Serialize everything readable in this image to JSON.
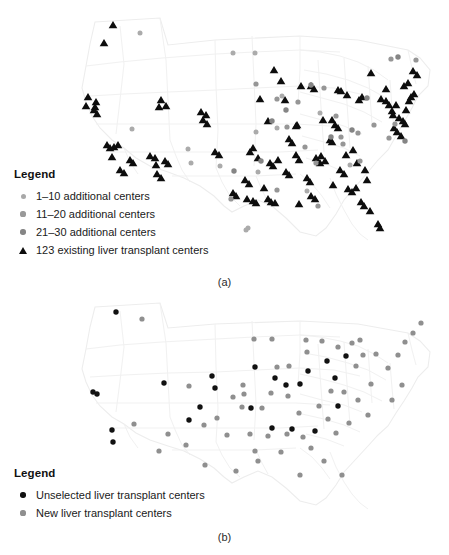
{
  "figure": {
    "background_color": "#ffffff",
    "map_outline_color": "#f2f2f2",
    "map_outline_color_inner": "#f5f5f5"
  },
  "panel_a": {
    "sublabel": "(a)",
    "legend": {
      "title": "Legend",
      "items": [
        {
          "label": "1–10 additional centers",
          "marker": "circle-icon",
          "color": "#a8a8a8",
          "size": 5.0
        },
        {
          "label": "11–20 additional centers",
          "marker": "circle-icon",
          "color": "#999999",
          "size": 5.2
        },
        {
          "label": "21–30 additional centers",
          "marker": "circle-icon",
          "color": "#858585",
          "size": 5.4
        },
        {
          "label": "123 existing liver transplant centers",
          "marker": "triangle-icon",
          "color": "#0d0d0d",
          "size": 7.2
        }
      ]
    },
    "chart_data": {
      "type": "scatter",
      "title": "",
      "subtitle": "",
      "xlabel": "",
      "ylabel": "",
      "grid": false,
      "legend_position": "lower-left",
      "projection": "usa-albers",
      "xlim": [
        0,
        449
      ],
      "ylim": [
        0,
        270
      ],
      "series": [
        {
          "name": "123 existing liver transplant centers",
          "marker": "triangle",
          "color": "#0d0d0d",
          "size": 7.2,
          "count": 123,
          "points": [
            [
              113,
              25
            ],
            [
              104,
              43
            ],
            [
              161,
              100
            ],
            [
              159,
              107
            ],
            [
              166,
              106
            ],
            [
              88,
              97
            ],
            [
              96,
              102
            ],
            [
              95,
              107
            ],
            [
              107,
              145
            ],
            [
              110,
              148
            ],
            [
              114,
              147
            ],
            [
              118,
              145
            ],
            [
              112,
              157
            ],
            [
              150,
              156
            ],
            [
              155,
              158
            ],
            [
              156,
              165
            ],
            [
              201,
              112
            ],
            [
              206,
              115
            ],
            [
              274,
              70
            ],
            [
              281,
              81
            ],
            [
              301,
              86
            ],
            [
              311,
              86
            ],
            [
              314,
              89
            ],
            [
              338,
              90
            ],
            [
              341,
              91
            ],
            [
              347,
              95
            ],
            [
              260,
              99
            ],
            [
              285,
              100
            ],
            [
              297,
              125
            ],
            [
              268,
              121
            ],
            [
              296,
              126
            ],
            [
              332,
              120
            ],
            [
              335,
              125
            ],
            [
              338,
              128
            ],
            [
              323,
              120
            ],
            [
              371,
              73
            ],
            [
              381,
              99
            ],
            [
              386,
              101
            ],
            [
              389,
              105
            ],
            [
              392,
              111
            ],
            [
              393,
              115
            ],
            [
              396,
              105
            ],
            [
              399,
              118
            ],
            [
              403,
              121
            ],
            [
              405,
              124
            ],
            [
              394,
              128
            ],
            [
              397,
              132
            ],
            [
              401,
              136
            ],
            [
              406,
              110
            ],
            [
              409,
              101
            ],
            [
              411,
              97
            ],
            [
              414,
              94
            ],
            [
              404,
              86
            ],
            [
              408,
              83
            ],
            [
              417,
              75
            ],
            [
              413,
              71
            ],
            [
              386,
              89
            ],
            [
              359,
              100
            ],
            [
              362,
              97
            ],
            [
              330,
              140
            ],
            [
              321,
              156
            ],
            [
              325,
              161
            ],
            [
              332,
              142
            ],
            [
              253,
              148
            ],
            [
              250,
              152
            ],
            [
              258,
              158
            ],
            [
              278,
              160
            ],
            [
              270,
              163
            ],
            [
              273,
              166
            ],
            [
              296,
              155
            ],
            [
              299,
              160
            ],
            [
              286,
              172
            ],
            [
              289,
              175
            ],
            [
              316,
              158
            ],
            [
              320,
              163
            ],
            [
              346,
              155
            ],
            [
              353,
              150
            ],
            [
              357,
              163
            ],
            [
              340,
              170
            ],
            [
              344,
              174
            ],
            [
              365,
              170
            ],
            [
              348,
              189
            ],
            [
              352,
              192
            ],
            [
              356,
              188
            ],
            [
              361,
              202
            ],
            [
              364,
              206
            ],
            [
              370,
              211
            ],
            [
              378,
              224
            ],
            [
              380,
              228
            ],
            [
              247,
              199
            ],
            [
              253,
              201
            ],
            [
              256,
              203
            ],
            [
              268,
              199
            ],
            [
              271,
              202
            ],
            [
              275,
              203
            ],
            [
              311,
              196
            ],
            [
              315,
              199
            ],
            [
              299,
              204
            ],
            [
              245,
              180
            ],
            [
              249,
              184
            ],
            [
              233,
              193
            ],
            [
              236,
              196
            ],
            [
              157,
              174
            ],
            [
              161,
              178
            ],
            [
              130,
              160
            ],
            [
              133,
              163
            ],
            [
              120,
              170
            ],
            [
              124,
              173
            ],
            [
              94,
              110
            ],
            [
              97,
              114
            ],
            [
              86,
              106
            ],
            [
              165,
              161
            ],
            [
              168,
              164
            ],
            [
              203,
              120
            ],
            [
              207,
              124
            ],
            [
              215,
              152
            ],
            [
              219,
              155
            ],
            [
              264,
              188
            ],
            [
              289,
              139
            ],
            [
              292,
              143
            ],
            [
              307,
              178
            ],
            [
              310,
              182
            ],
            [
              333,
              185
            ],
            [
              367,
              180
            ]
          ]
        },
        {
          "name": "1–10 additional centers",
          "marker": "circle",
          "color": "#ababab",
          "size": 5.0,
          "points": [
            [
              140,
              33
            ],
            [
              233,
              53
            ],
            [
              255,
              53
            ],
            [
              132,
              129
            ],
            [
              188,
              149
            ],
            [
              220,
              166
            ],
            [
              256,
              132
            ],
            [
              282,
              96
            ],
            [
              258,
              172
            ],
            [
              307,
              191
            ],
            [
              248,
              228
            ],
            [
              191,
              163
            ],
            [
              350,
              165
            ],
            [
              320,
              113
            ],
            [
              277,
              128
            ],
            [
              246,
              230
            ]
          ]
        },
        {
          "name": "11–20 additional centers",
          "marker": "circle",
          "color": "#969696",
          "size": 5.2,
          "points": [
            [
              256,
              84
            ],
            [
              277,
              99
            ],
            [
              287,
              127
            ],
            [
              324,
              88
            ],
            [
              336,
              116
            ],
            [
              316,
              163
            ],
            [
              343,
              144
            ],
            [
              360,
              161
            ],
            [
              391,
              59
            ],
            [
              416,
              60
            ],
            [
              395,
              124
            ],
            [
              341,
              137
            ],
            [
              305,
              147
            ],
            [
              358,
              133
            ],
            [
              298,
              102
            ],
            [
              231,
              199
            ],
            [
              277,
              190
            ],
            [
              318,
              206
            ],
            [
              374,
              125
            ],
            [
              389,
              138
            ]
          ]
        },
        {
          "name": "21–30 additional centers",
          "marker": "circle",
          "color": "#858585",
          "size": 5.4,
          "points": [
            [
              311,
              85
            ],
            [
              272,
              121
            ],
            [
              331,
              137
            ],
            [
              352,
              130
            ],
            [
              367,
              98
            ],
            [
              398,
              57
            ],
            [
              405,
              141
            ],
            [
              286,
              110
            ],
            [
              261,
              161
            ],
            [
              234,
              171
            ]
          ]
        }
      ]
    }
  },
  "panel_b": {
    "sublabel": "(b)",
    "legend": {
      "title": "Legend",
      "items": [
        {
          "label": "Unselected liver transplant centers",
          "marker": "circle-icon",
          "color": "#111111",
          "size": 5.4
        },
        {
          "label": "New liver transplant centers",
          "marker": "circle-icon",
          "color": "#8f8f8f",
          "size": 5.2
        }
      ]
    },
    "chart_data": {
      "type": "scatter",
      "title": "",
      "subtitle": "",
      "xlabel": "",
      "ylabel": "",
      "grid": false,
      "legend_position": "lower-left",
      "projection": "usa-albers",
      "xlim": [
        0,
        449
      ],
      "ylim": [
        0,
        230
      ],
      "series": [
        {
          "name": "Unselected liver transplant centers",
          "marker": "circle",
          "color": "#111111",
          "size": 5.4,
          "points": [
            [
              116,
              17
            ],
            [
              93,
              97
            ],
            [
              97,
              99
            ],
            [
              112,
              135
            ],
            [
              113,
              147
            ],
            [
              164,
              88
            ],
            [
              212,
              81
            ],
            [
              215,
              93
            ],
            [
              255,
              72
            ],
            [
              275,
              83
            ],
            [
              286,
              90
            ],
            [
              300,
              89
            ],
            [
              308,
              76
            ],
            [
              327,
              66
            ],
            [
              335,
              83
            ],
            [
              346,
              61
            ],
            [
              251,
              113
            ],
            [
              272,
              133
            ],
            [
              292,
              134
            ],
            [
              315,
              136
            ],
            [
              200,
              112
            ],
            [
              189,
              125
            ],
            [
              338,
              111
            ]
          ]
        },
        {
          "name": "New liver transplant centers",
          "marker": "circle",
          "color": "#8f8f8f",
          "size": 5.2,
          "points": [
            [
              142,
              24
            ],
            [
              189,
              91
            ],
            [
              254,
              44
            ],
            [
              272,
              44
            ],
            [
              306,
              45
            ],
            [
              322,
              46
            ],
            [
              277,
              72
            ],
            [
              289,
              71
            ],
            [
              307,
              57
            ],
            [
              338,
              52
            ],
            [
              352,
              48
            ],
            [
              360,
              45
            ],
            [
              363,
              60
            ],
            [
              376,
              59
            ],
            [
              356,
              71
            ],
            [
              271,
              98
            ],
            [
              288,
              101
            ],
            [
              243,
              90
            ],
            [
              244,
              99
            ],
            [
              233,
              102
            ],
            [
              242,
              112
            ],
            [
              262,
              113
            ],
            [
              299,
              118
            ],
            [
              331,
              96
            ],
            [
              344,
              97
            ],
            [
              328,
              124
            ],
            [
              319,
              111
            ],
            [
              217,
              123
            ],
            [
              204,
              130
            ],
            [
              227,
              140
            ],
            [
              250,
              139
            ],
            [
              268,
              141
            ],
            [
              287,
              139
            ],
            [
              303,
              142
            ],
            [
              255,
              156
            ],
            [
              281,
              157
            ],
            [
              311,
              153
            ],
            [
              336,
              138
            ],
            [
              349,
              128
            ],
            [
              368,
              120
            ],
            [
              186,
              150
            ],
            [
              168,
              139
            ],
            [
              159,
              156
            ],
            [
              134,
              129
            ],
            [
              358,
              105
            ],
            [
              371,
              89
            ],
            [
              388,
              73
            ],
            [
              398,
              60
            ],
            [
              405,
              47
            ],
            [
              413,
              38
            ],
            [
              402,
              90
            ],
            [
              392,
              105
            ],
            [
              421,
              28
            ],
            [
              205,
              170
            ],
            [
              236,
              176
            ],
            [
              258,
              166
            ],
            [
              324,
              166
            ],
            [
              342,
              180
            ],
            [
              300,
              180
            ]
          ]
        }
      ]
    }
  }
}
